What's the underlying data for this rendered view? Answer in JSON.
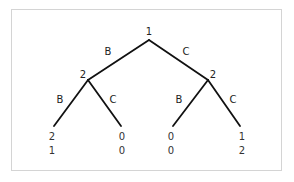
{
  "diagram": {
    "type": "extensive-form game tree",
    "root": {
      "player": "1",
      "x": 149,
      "y": 40
    },
    "nodes": [
      {
        "id": "p2-left",
        "player": "2",
        "x": 88,
        "y": 80
      },
      {
        "id": "p2-right",
        "player": "2",
        "x": 208,
        "y": 80
      }
    ],
    "edges": [
      {
        "from": [
          149,
          40
        ],
        "to": [
          88,
          80
        ],
        "label": "B",
        "label_pos": [
          108,
          51
        ]
      },
      {
        "from": [
          149,
          40
        ],
        "to": [
          208,
          80
        ],
        "label": "C",
        "label_pos": [
          186,
          51
        ]
      },
      {
        "from": [
          88,
          80
        ],
        "to": [
          54,
          126
        ],
        "label": "B",
        "label_pos": [
          60,
          99
        ]
      },
      {
        "from": [
          88,
          80
        ],
        "to": [
          121,
          126
        ],
        "label": "C",
        "label_pos": [
          113,
          99
        ]
      },
      {
        "from": [
          208,
          80
        ],
        "to": [
          173,
          126
        ],
        "label": "B",
        "label_pos": [
          179,
          99
        ]
      },
      {
        "from": [
          208,
          80
        ],
        "to": [
          240,
          126
        ],
        "label": "C",
        "label_pos": [
          233,
          99
        ]
      }
    ],
    "node_labels": [
      {
        "text": "1",
        "x": 149,
        "y": 31
      },
      {
        "text": "2",
        "x": 83,
        "y": 74
      },
      {
        "text": "2",
        "x": 213,
        "y": 74
      }
    ],
    "leaves": [
      {
        "x": 52,
        "payoffs": [
          "2",
          "1"
        ]
      },
      {
        "x": 122,
        "payoffs": [
          "0",
          "0"
        ]
      },
      {
        "x": 171,
        "payoffs": [
          "0",
          "0"
        ]
      },
      {
        "x": 242,
        "payoffs": [
          "1",
          "2"
        ]
      }
    ],
    "payoff_rows_y": [
      137,
      151
    ],
    "colors": {
      "line": "#111111",
      "text": "#222222",
      "border": "#d4d4d4"
    }
  },
  "labels": {
    "root_player": "1",
    "left_player": "2",
    "right_player": "2",
    "edge_root_left": "B",
    "edge_root_right": "C",
    "edge_left_left": "B",
    "edge_left_right": "C",
    "edge_right_left": "B",
    "edge_right_right": "C",
    "leaf1_p1": "2",
    "leaf1_p2": "1",
    "leaf2_p1": "0",
    "leaf2_p2": "0",
    "leaf3_p1": "0",
    "leaf3_p2": "0",
    "leaf4_p1": "1",
    "leaf4_p2": "2"
  }
}
